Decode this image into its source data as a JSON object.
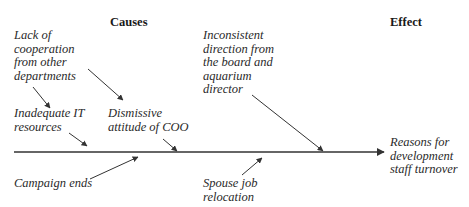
{
  "headers": {
    "causes": "Causes",
    "effect": "Effect"
  },
  "causes": [
    {
      "id": "lack-of-cooperation",
      "text": "Lack of\ncooperation\nfrom other\ndepartments"
    },
    {
      "id": "inadequate-it",
      "text": "Inadequate IT\nresources"
    },
    {
      "id": "dismissive-coo",
      "text": "Dismissive\nattitude of COO"
    },
    {
      "id": "campaign-ends",
      "text": "Campaign ends"
    },
    {
      "id": "inconsistent-direction",
      "text": "Inconsistent\ndirection from\nthe board and\naquarium\ndirector"
    },
    {
      "id": "spouse-relocation",
      "text": "Spouse job\nrelocation"
    }
  ],
  "effect": {
    "text": "Reasons for\ndevelopment\nstaff turnover"
  },
  "colors": {
    "line": "#333333",
    "text": "#2a2a2a",
    "background": "#ffffff"
  }
}
